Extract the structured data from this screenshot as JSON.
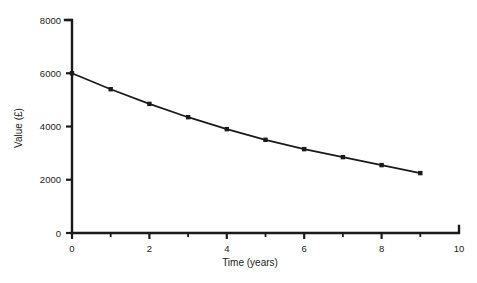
{
  "chart_data": {
    "type": "line",
    "title": "",
    "subtitle": "",
    "xlabel": "Time (years)",
    "ylabel": "Value (£)",
    "xlim": [
      0,
      10
    ],
    "ylim": [
      0,
      8000
    ],
    "grid": false,
    "legend": false,
    "legend_position": "none",
    "x_major_ticks": [
      0,
      2,
      4,
      6,
      8,
      10
    ],
    "x_minor_ticks": [
      1,
      3,
      5,
      7,
      9
    ],
    "x_tick_labels": [
      "0",
      "2",
      "4",
      "6",
      "8",
      "10"
    ],
    "y_major_ticks": [
      0,
      2000,
      4000,
      6000,
      8000
    ],
    "y_tick_labels": [
      "0",
      "2000",
      "4000",
      "6000",
      "8000"
    ],
    "marker": "square",
    "line_color": "#1a1a1a",
    "marker_color": "#1a1a1a",
    "series": [
      {
        "name": "Value",
        "x": [
          0,
          1,
          2,
          3,
          4,
          5,
          6,
          7,
          8,
          9
        ],
        "values": [
          6000,
          5400,
          4850,
          4350,
          3900,
          3500,
          3150,
          2850,
          2550,
          2250
        ]
      }
    ]
  },
  "colors": {
    "background": "#ffffff",
    "ink": "#1a1a1a"
  }
}
